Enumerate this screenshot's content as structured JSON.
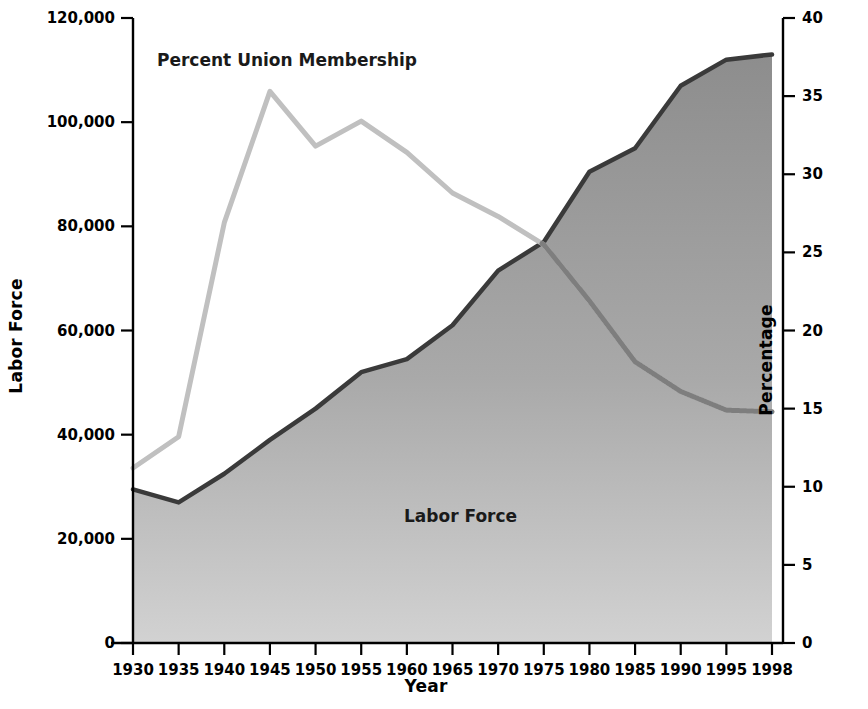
{
  "chart_data": {
    "type": "area",
    "title": "",
    "xlabel": "Year",
    "ylabel": "Labor Force",
    "y2label": "Percentage",
    "x": [
      1930,
      1935,
      1940,
      1945,
      1950,
      1955,
      1960,
      1965,
      1970,
      1975,
      1980,
      1985,
      1990,
      1995,
      1998
    ],
    "xtick_labels": [
      "1930",
      "1935",
      "1940",
      "1945",
      "1950",
      "1955",
      "1960",
      "1965",
      "1970",
      "1975",
      "1980",
      "1985",
      "1990",
      "1995",
      "1998"
    ],
    "ylim": [
      0,
      120000
    ],
    "ytick_labels": [
      "0",
      "20,000",
      "40,000",
      "60,000",
      "80,000",
      "100,000",
      "120,000"
    ],
    "yticks": [
      0,
      20000,
      40000,
      60000,
      80000,
      100000,
      120000
    ],
    "y2lim": [
      0,
      40
    ],
    "y2tick_labels": [
      "0",
      "5",
      "10",
      "15",
      "20",
      "25",
      "30",
      "35",
      "40"
    ],
    "y2ticks": [
      0,
      5,
      10,
      15,
      20,
      25,
      30,
      35,
      40
    ],
    "grid": false,
    "legend_position": "inline-annotations",
    "series": [
      {
        "name": "Labor Force",
        "kind": "area",
        "axis": "left",
        "color": "#8a8a8a",
        "line_color": "#3d3d3d",
        "values": [
          29500,
          27000,
          32500,
          39000,
          45000,
          52000,
          54500,
          61000,
          71500,
          77000,
          90500,
          95000,
          107000,
          112000,
          113000
        ]
      },
      {
        "name": "Percent Union Membership",
        "kind": "line",
        "axis": "right",
        "color": "#bfbfbf",
        "values": [
          11.2,
          13.2,
          26.9,
          35.3,
          31.8,
          33.4,
          31.4,
          28.8,
          27.3,
          25.5,
          21.9,
          18.0,
          16.1,
          14.9,
          14.8
        ]
      }
    ],
    "annotations": [
      {
        "text": "Percent Union Membership",
        "x": 1933.5,
        "y": 37.0
      },
      {
        "text": "Labor Force",
        "x": 1960.0,
        "y": 9.0
      }
    ]
  },
  "axes": {
    "left_title": "Labor Force",
    "right_title": "Percentage",
    "bottom_title": "Year"
  },
  "colors": {
    "area_fill_top": "#8d8d8d",
    "area_fill_bottom": "#cfcfcf",
    "area_outline": "#3a3a3a",
    "union_line": "#c0c0c0",
    "union_line_over_area": "#7a7a7a",
    "axis": "#000000",
    "text": "#000000",
    "background": "#ffffff"
  }
}
